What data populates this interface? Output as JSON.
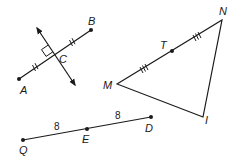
{
  "figure": {
    "width": 238,
    "height": 164,
    "stroke_color": "#1a1a1a",
    "background": "#ffffff"
  },
  "bisector_figure": {
    "segment": {
      "from": "A",
      "to": "B",
      "midpoint": "C"
    },
    "labels": {
      "A": "A",
      "B": "B",
      "C": "C"
    },
    "perpendicular_line": "line through C with arrows both ends",
    "right_angle_marker": true,
    "tick_marks_per_half": 2
  },
  "triangle_figure": {
    "vertices": {
      "M": "M",
      "N": "N",
      "I": "I"
    },
    "midpoint": {
      "label": "T",
      "on_side": "MN"
    },
    "tick_marks_per_half": 3
  },
  "segment_figure": {
    "endpoints": {
      "Q": "Q",
      "D": "D"
    },
    "midpoint": {
      "label": "E"
    },
    "lengths": {
      "QE": "8",
      "ED": "8"
    }
  }
}
